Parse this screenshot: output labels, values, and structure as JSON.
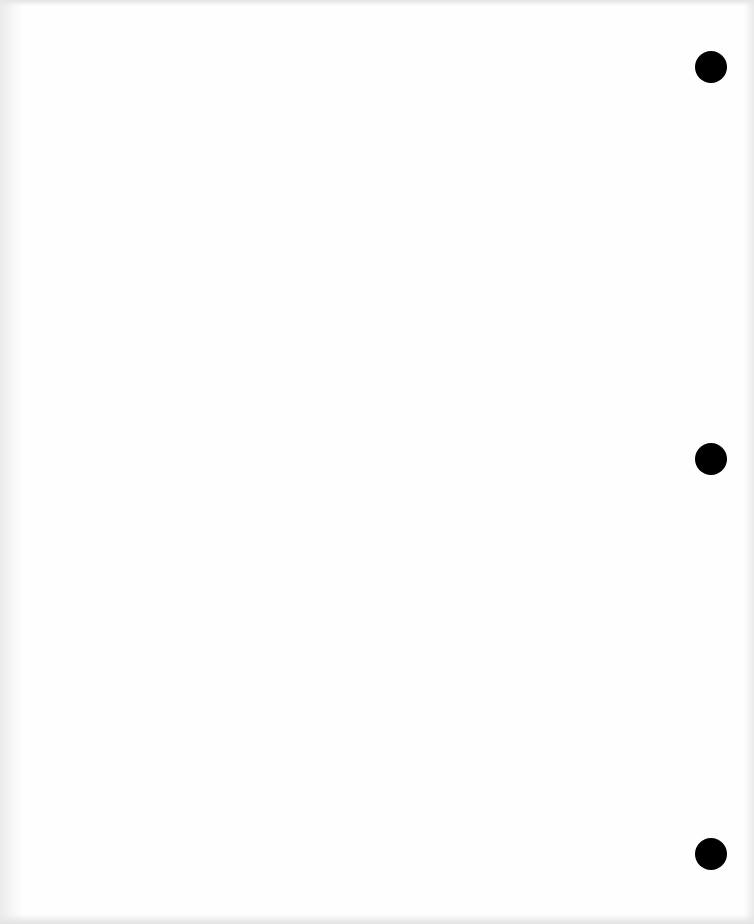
{
  "page": {
    "type": "blank three-hole-punched sheet",
    "background_color": "#fefefe",
    "text": ""
  },
  "punch_holes": [
    {
      "cx": 711,
      "cy": 67,
      "diameter": 32,
      "color": "#000000"
    },
    {
      "cx": 711,
      "cy": 459,
      "diameter": 32,
      "color": "#000000"
    },
    {
      "cx": 711,
      "cy": 854,
      "diameter": 32,
      "color": "#000000"
    }
  ]
}
